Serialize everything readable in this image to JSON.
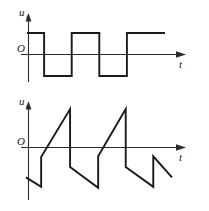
{
  "figure": {
    "title": "",
    "background_color": "#ffffff",
    "line_color": "#1a1a1a",
    "axis_color": "#2b2b2b"
  },
  "panels": [
    {
      "name": "input-waveform",
      "y_axis_label": "u",
      "y_axis_subscript": "i",
      "x_axis_label": "t",
      "origin_label": "O"
    },
    {
      "name": "output-waveform",
      "y_axis_label": "u",
      "y_axis_subscript": "o",
      "x_axis_label": "t",
      "origin_label": "O"
    }
  ],
  "chart_data": [
    {
      "type": "line",
      "name": "input-square-wave",
      "title": "",
      "xlabel": "t",
      "ylabel": "u_i",
      "grid": false,
      "legend": "none",
      "xlim": [
        0,
        6
      ],
      "ylim": [
        -1.3,
        1.3
      ],
      "waveform": "square",
      "description": "Bipolar square wave, equal high and low durations, starting at the high level.",
      "x": [
        0.0,
        0.62,
        0.62,
        1.62,
        1.62,
        2.62,
        2.62,
        3.62,
        3.62,
        4.62,
        4.62,
        5.0
      ],
      "y": [
        1,
        1,
        -1,
        -1,
        1,
        1,
        -1,
        -1,
        1,
        1,
        1,
        1
      ],
      "levels": {
        "high": 1,
        "low": -1,
        "zero": 0
      }
    },
    {
      "type": "line",
      "name": "output-sawtooth-wave",
      "title": "",
      "xlabel": "t",
      "ylabel": "u_o",
      "grid": false,
      "legend": "none",
      "xlim": [
        0,
        6
      ],
      "ylim": [
        -1.5,
        1.5
      ],
      "waveform": "triangular-sawtooth",
      "description": "Integrator output: ramps rising and falling with steep vertical edges at each input transition.",
      "x": [
        0.0,
        0.55,
        0.55,
        1.6,
        1.6,
        2.62,
        2.62,
        3.62,
        3.62,
        4.62,
        4.62,
        5.3
      ],
      "y": [
        -0.95,
        -1.25,
        -0.3,
        1.22,
        -0.62,
        -1.28,
        -0.28,
        1.22,
        -0.62,
        -1.25,
        -0.28,
        -0.95
      ],
      "levels": {
        "peak": 1.22,
        "trough": -1.28,
        "zero": 0
      }
    }
  ]
}
